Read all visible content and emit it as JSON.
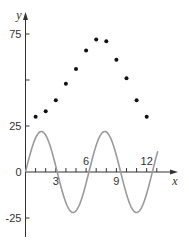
{
  "chart_data": {
    "type": "scatter",
    "title": "",
    "xlabel": "x",
    "ylabel": "y",
    "xlim": [
      0,
      15
    ],
    "ylim": [
      -35,
      88
    ],
    "grid": false,
    "legend": null,
    "x_ticks": [
      1,
      2,
      3,
      4,
      5,
      6,
      7,
      8,
      9,
      10,
      11,
      12,
      13
    ],
    "x_tick_labels": [
      {
        "value": 3,
        "label": "3",
        "position": "below"
      },
      {
        "value": 6,
        "label": "6",
        "position": "above"
      },
      {
        "value": 9,
        "label": "9",
        "position": "below"
      },
      {
        "value": 12,
        "label": "12",
        "position": "above"
      }
    ],
    "y_ticks": [
      -25,
      0,
      25,
      50,
      75
    ],
    "y_tick_labels": [
      {
        "value": 75,
        "label": "75"
      },
      {
        "value": 25,
        "label": "25"
      },
      {
        "value": 0,
        "label": "0"
      },
      {
        "value": -25,
        "label": "-25"
      }
    ],
    "series": [
      {
        "name": "data points",
        "type": "scatter",
        "color": "#111111",
        "x": [
          1,
          2,
          3,
          4,
          5,
          6,
          7,
          8,
          9,
          10,
          11,
          12
        ],
        "y": [
          30,
          33,
          39,
          48,
          56,
          66,
          72,
          71,
          61,
          51,
          39,
          30
        ]
      },
      {
        "name": "sine curve",
        "type": "line",
        "color": "#9a9a9a",
        "function": "y = 22 sin(x)",
        "amplitude": 22,
        "period": 6.28,
        "x_range": [
          0,
          13.1
        ]
      }
    ],
    "colors": {
      "axis": "#333333",
      "points": "#111111",
      "curve": "#9a9a9a"
    }
  }
}
